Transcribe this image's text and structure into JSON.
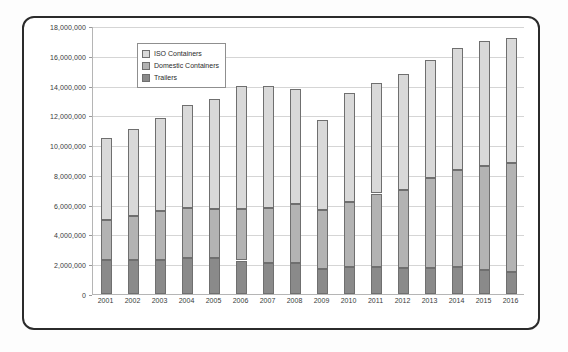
{
  "chart_data": {
    "type": "bar",
    "stacked": true,
    "title": "",
    "subtitle": "",
    "xlabel": "",
    "ylabel": "",
    "grid": true,
    "legend_position": "top-left-inside",
    "ylim": [
      0,
      18000000
    ],
    "ytick_labels": [
      "18,000,000",
      "16,000,000",
      "14,000,000",
      "12,000,000",
      "10,000,000",
      "8,000,000",
      "6,000,000",
      "4,000,000",
      "2,000,000",
      "0"
    ],
    "ytick_values": [
      18000000,
      16000000,
      14000000,
      12000000,
      10000000,
      8000000,
      6000000,
      4000000,
      2000000,
      0
    ],
    "categories": [
      "2001",
      "2002",
      "2003",
      "2004",
      "2005",
      "2006",
      "2007",
      "2008",
      "2009",
      "2010",
      "2011",
      "2012",
      "2013",
      "2014",
      "2015",
      "2016"
    ],
    "series": [
      {
        "name": "Trailers",
        "color": "#8a8a8a",
        "values": [
          2300000,
          2300000,
          2300000,
          2450000,
          2400000,
          2250000,
          2100000,
          2050000,
          1700000,
          1800000,
          1800000,
          1750000,
          1750000,
          1800000,
          1600000,
          1450000
        ]
      },
      {
        "name": "Domestic Containers",
        "color": "#b3b3b3",
        "values": [
          2700000,
          2950000,
          3250000,
          3350000,
          3300000,
          3450000,
          3700000,
          4000000,
          3950000,
          4400000,
          4950000,
          5250000,
          6050000,
          6500000,
          7000000,
          7350000
        ]
      },
      {
        "name": "ISO Containers",
        "color": "#d9d9d9",
        "values": [
          5450000,
          5800000,
          6250000,
          6900000,
          7400000,
          8300000,
          8200000,
          7700000,
          6050000,
          7300000,
          7450000,
          7800000,
          7900000,
          8200000,
          8400000,
          8400000
        ]
      }
    ],
    "totals": [
      10450000,
      11050000,
      11800000,
      12700000,
      13100000,
      14000000,
      14000000,
      13750000,
      11700000,
      13500000,
      14200000,
      14800000,
      15700000,
      16500000,
      17000000,
      17200000
    ]
  },
  "legend": {
    "items": [
      {
        "label": "ISO Containers"
      },
      {
        "label": "Domestic Containers"
      },
      {
        "label": "Trailers"
      }
    ]
  }
}
